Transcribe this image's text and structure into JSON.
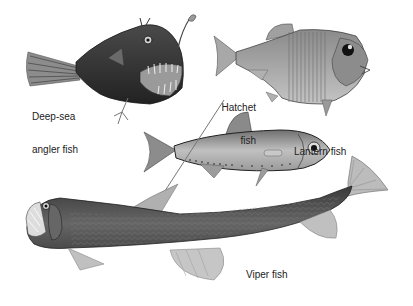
{
  "colors": {
    "background": "#ffffff",
    "label_text": "#222222",
    "angler_body": "#3a3a3a",
    "hatchet_body": "#9a9a9a",
    "lantern_body": "#a8a8a8",
    "viper_body": "#555555",
    "fin": "#b5b5b5"
  },
  "fish": [
    {
      "id": "angler",
      "name": "Deep-sea angler fish",
      "label_lines": [
        "Deep-sea",
        "angler fish"
      ]
    },
    {
      "id": "hatchet",
      "name": "Hatchet fish",
      "label_lines": [
        "Hatchet",
        "fish"
      ]
    },
    {
      "id": "lantern",
      "name": "Lantern fish",
      "label_lines": [
        "Lantern fish"
      ]
    },
    {
      "id": "viper",
      "name": "Viper fish",
      "label_lines": [
        "Viper fish"
      ]
    }
  ]
}
